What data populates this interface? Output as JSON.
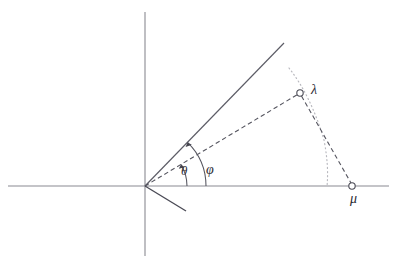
{
  "figure": {
    "type": "geometric-diagram",
    "title": "",
    "background_color": "#ffffff",
    "width": 397,
    "height": 270,
    "axes": {
      "origin": {
        "x": 145,
        "y": 186
      },
      "x_axis": {
        "name": "horizontal-axis",
        "x1": 8,
        "y1": 186,
        "x2": 389,
        "y2": 186,
        "color": "#8a8a92"
      },
      "y_axis": {
        "name": "vertical-axis",
        "x1": 145,
        "y1": 12,
        "x2": 145,
        "y2": 256,
        "color": "#8a8a92"
      }
    },
    "rays": [
      {
        "name": "upper-solid-ray",
        "x1": 145,
        "y1": 186,
        "x2": 284,
        "y2": 43,
        "color": "#5c5c66",
        "style": "solid"
      },
      {
        "name": "lower-solid-ray",
        "x1": 145,
        "y1": 186,
        "x2": 186,
        "y2": 211,
        "color": "#4a4a55",
        "style": "solid"
      }
    ],
    "dashed_lines": [
      {
        "name": "origin-to-lambda-dashed",
        "x1": 145,
        "y1": 186,
        "x2": 300,
        "y2": 93,
        "color": "#55555f",
        "style": "dashed"
      },
      {
        "name": "lambda-to-mu-dashed",
        "x1": 300,
        "y1": 93,
        "x2": 352,
        "y2": 186,
        "color": "#55555f",
        "style": "dashed"
      }
    ],
    "dotted_curve": {
      "name": "dotted-arc-lambda-to-axis",
      "color": "#b9b9bf",
      "style": "dotted",
      "path": "M 289,68 Q 311,96 324,140 Q 329,165 327,186"
    },
    "angle_arcs": [
      {
        "name": "theta-angle-arc",
        "label": "θ",
        "radius": 42,
        "from_deg": 0,
        "to_deg": 31,
        "color": "#55555f",
        "arrowhead": true,
        "label_pos": {
          "x": 186,
          "y": 171
        }
      },
      {
        "name": "phi-angle-arc",
        "label": "φ",
        "radius": 61,
        "from_deg": 0,
        "to_deg": 45.8,
        "color": "#55555f",
        "arrowhead": true,
        "label_pos": {
          "x": 212,
          "y": 170
        }
      }
    ],
    "points": [
      {
        "name": "point-lambda",
        "label": "λ",
        "x": 300,
        "y": 93,
        "marker": "open-circle",
        "radius": 3.2,
        "color": "#4a4a55",
        "label_offset": {
          "dx": 11,
          "dy": -3
        }
      },
      {
        "name": "point-mu",
        "label": "μ",
        "x": 352,
        "y": 186,
        "marker": "open-circle",
        "radius": 3.2,
        "color": "#4a4a55",
        "label_offset": {
          "dx": 3,
          "dy": 13
        }
      }
    ],
    "labels": {
      "theta": "θ",
      "phi": "φ",
      "lambda": "λ",
      "mu": "μ"
    },
    "colors": {
      "axis": "#8a8a92",
      "ray": "#5c5c66",
      "dashed": "#55555f",
      "dotted": "#b9b9bf",
      "text": "#2b2b33"
    }
  }
}
